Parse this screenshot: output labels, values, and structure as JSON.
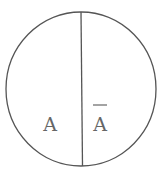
{
  "diagram": {
    "type": "venn-complement",
    "regions": [
      {
        "id": "event",
        "label": "A"
      },
      {
        "id": "complement",
        "label": "A",
        "overline": true,
        "meaning": "A-bar (complement of A)"
      }
    ],
    "colors": {
      "stroke": "#555555",
      "text": "#666666",
      "background": "#ffffff"
    }
  }
}
